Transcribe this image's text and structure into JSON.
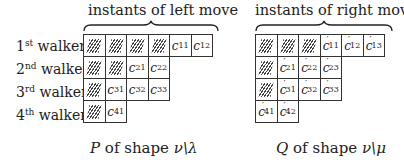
{
  "left": {
    "header": "instants of left move",
    "caption_prefix": "P",
    "caption_text": " of shape ",
    "caption_shape": "ν\\λ",
    "rows": [
      {
        "label_num": "1",
        "label_sup": "st",
        "label_word": " walker",
        "hatched": 4,
        "cells": [
          {
            "base": "c",
            "sub": "11"
          },
          {
            "base": "c",
            "sub": "12"
          }
        ]
      },
      {
        "label_num": "2",
        "label_sup": "nd",
        "label_word": " walker",
        "hatched": 2,
        "cells": [
          {
            "base": "c",
            "sub": "21"
          },
          {
            "base": "c",
            "sub": "22"
          }
        ]
      },
      {
        "label_num": "3",
        "label_sup": "rd",
        "label_word": " walker",
        "hatched": 1,
        "cells": [
          {
            "base": "c",
            "sub": "31"
          },
          {
            "base": "c",
            "sub": "32"
          },
          {
            "base": "c",
            "sub": "33"
          }
        ]
      },
      {
        "label_num": "4",
        "label_sup": "th",
        "label_word": " walker",
        "hatched": 1,
        "cells": [
          {
            "base": "c",
            "sub": "41"
          }
        ]
      }
    ]
  },
  "right": {
    "header": "instants of right move",
    "caption_prefix": "Q",
    "caption_text": " of shape ",
    "caption_shape": "ν\\μ",
    "rows": [
      {
        "hatched": 3,
        "cells": [
          {
            "base": "c",
            "prime": "′",
            "sub": "11"
          },
          {
            "base": "c",
            "prime": "′",
            "sub": "12"
          },
          {
            "base": "c",
            "prime": "′",
            "sub": "13"
          }
        ]
      },
      {
        "hatched": 1,
        "cells": [
          {
            "base": "c",
            "prime": "′",
            "sub": "21"
          },
          {
            "base": "c",
            "prime": "′",
            "sub": "22"
          },
          {
            "base": "c",
            "prime": "′",
            "sub": "23"
          }
        ]
      },
      {
        "hatched": 1,
        "cells": [
          {
            "base": "c",
            "prime": "′",
            "sub": "31"
          },
          {
            "base": "c",
            "prime": "′",
            "sub": "32"
          },
          {
            "base": "c",
            "prime": "′",
            "sub": "33"
          }
        ]
      },
      {
        "hatched": 0,
        "cells": [
          {
            "base": "c",
            "prime": "′",
            "sub": "41"
          },
          {
            "base": "c",
            "prime": "′",
            "sub": "42"
          }
        ]
      }
    ]
  }
}
